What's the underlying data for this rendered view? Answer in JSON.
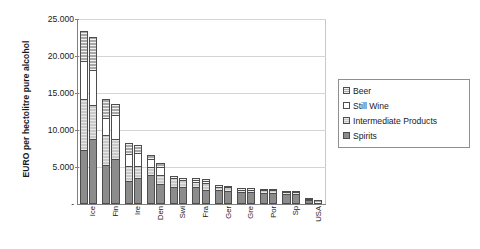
{
  "chart_data": {
    "type": "bar",
    "stacked": true,
    "grouped": true,
    "title": "",
    "xlabel": "",
    "ylabel": "EURO per hectolitre pure alcohol",
    "ylim": [
      0,
      25000
    ],
    "ytick_labels": [
      "-",
      "5.000",
      "10.000",
      "15.000",
      "20.000",
      "25.000"
    ],
    "ytick_values": [
      0,
      5000,
      10000,
      15000,
      20000,
      25000
    ],
    "grid": "horizontal",
    "legend_position": "right",
    "legend": [
      "Beer",
      "Still Wine",
      "Intermediate Products",
      "Spirits"
    ],
    "categories": [
      "Ice",
      "Fin",
      "Ire",
      "Den",
      "Swi",
      "Fra",
      "Ger",
      "Gre",
      "Por",
      "Sp",
      "USA"
    ],
    "bars_per_category": 2,
    "series": [
      {
        "name": "Spirits",
        "color": "#8c8c8c",
        "values": [
          [
            7200,
            8700
          ],
          [
            5100,
            5900
          ],
          [
            2950,
            3350
          ],
          [
            3850,
            2600
          ],
          [
            2150,
            2150
          ],
          [
            2100,
            1800
          ],
          [
            1750,
            1600
          ],
          [
            1500,
            1500
          ],
          [
            1400,
            1400
          ],
          [
            1250,
            1200
          ],
          [
            400,
            0
          ]
        ]
      },
      {
        "name": "Intermediate Products",
        "color": "#c9c9c9",
        "values": [
          [
            6800,
            4600
          ],
          [
            4050,
            2800
          ],
          [
            2050,
            1650
          ],
          [
            1000,
            1250
          ],
          [
            1200,
            950
          ],
          [
            700,
            850
          ],
          [
            450,
            500
          ],
          [
            300,
            300
          ],
          [
            300,
            300
          ],
          [
            250,
            250
          ],
          [
            150,
            0
          ]
        ]
      },
      {
        "name": "Still Wine",
        "color": "#ffffff",
        "values": [
          [
            5150,
            4700
          ],
          [
            2350,
            3150
          ],
          [
            1650,
            1700
          ],
          [
            1100,
            1050
          ],
          [
            0,
            0
          ],
          [
            350,
            350
          ],
          [
            0,
            0
          ],
          [
            0,
            0
          ],
          [
            0,
            0
          ],
          [
            0,
            0
          ],
          [
            0,
            0
          ]
        ]
      },
      {
        "name": "Beer",
        "color": "#a8a8a8",
        "values": [
          [
            4050,
            4500
          ],
          [
            2500,
            1550
          ],
          [
            1500,
            1200
          ],
          [
            550,
            500
          ],
          [
            250,
            300
          ],
          [
            250,
            250
          ],
          [
            250,
            250
          ],
          [
            200,
            200
          ],
          [
            150,
            150
          ],
          [
            150,
            150
          ],
          [
            100,
            350
          ]
        ]
      }
    ]
  }
}
